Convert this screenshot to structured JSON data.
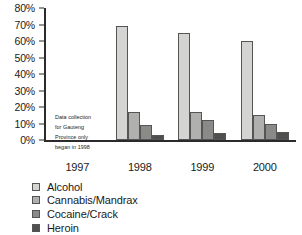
{
  "chart_data": {
    "type": "bar",
    "title": "",
    "subtitle": "",
    "xlabel": "",
    "ylabel": "",
    "categories": [
      "1997",
      "1998",
      "1999",
      "2000"
    ],
    "series": [
      {
        "name": "Alcohol",
        "color": "#d4d4d2",
        "values": [
          null,
          69,
          65,
          60
        ]
      },
      {
        "name": "Cannabis/Mandrax",
        "color": "#b0b0ae",
        "values": [
          null,
          17,
          17,
          15
        ]
      },
      {
        "name": "Cocaine/Crack",
        "color": "#8a8a88",
        "values": [
          null,
          9,
          12,
          10
        ]
      },
      {
        "name": "Heroin",
        "color": "#4f4f4e",
        "values": [
          null,
          3,
          4,
          5
        ]
      }
    ],
    "ylim": [
      0,
      80
    ],
    "ytick_values": [
      0,
      10,
      20,
      30,
      40,
      50,
      60,
      70,
      80
    ],
    "ytick_labels": [
      "0%",
      "10%",
      "20%",
      "30%",
      "40%",
      "50%",
      "60%",
      "70%",
      "80%"
    ],
    "grid": false,
    "legend_position": "bottom-left",
    "annotations": [
      {
        "text": "Data collection for Gauteng Province only began in 1998",
        "lines": [
          "Data collection",
          "for Gauteng",
          "Province only",
          "began in 1998"
        ]
      }
    ],
    "axis_color": "#2b2b2b",
    "bar_border_color": "#555555",
    "background": "#ffffff"
  }
}
